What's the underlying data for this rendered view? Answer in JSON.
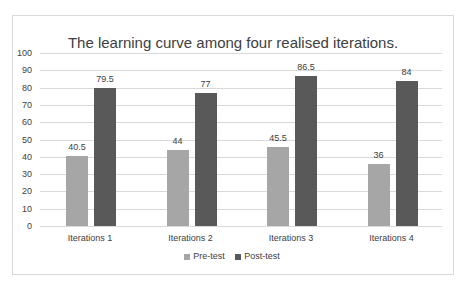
{
  "chart_data": {
    "type": "bar",
    "title": "The learning curve among four realised iterations.",
    "categories": [
      "Iterations 1",
      "Iterations 2",
      "Iterations 3",
      "Iterations 4"
    ],
    "series": [
      {
        "name": "Pre-test",
        "values": [
          40.5,
          44,
          45.5,
          36
        ],
        "color": "#a6a6a6"
      },
      {
        "name": "Post-test",
        "values": [
          79.5,
          77,
          86.5,
          84
        ],
        "color": "#595959"
      }
    ],
    "value_labels": {
      "pre": [
        "40.5",
        "44",
        "45.5",
        "36"
      ],
      "post": [
        "79.5",
        "77",
        "86.5",
        "84"
      ]
    },
    "xlabel": "",
    "ylabel": "",
    "ylim": [
      0,
      100
    ],
    "yticks": [
      "0",
      "10",
      "20",
      "30",
      "40",
      "50",
      "60",
      "70",
      "80",
      "90",
      "100"
    ],
    "grid": true,
    "legend_position": "bottom"
  }
}
